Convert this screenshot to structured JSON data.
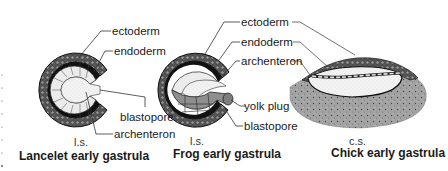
{
  "figure": {
    "panels": [
      {
        "id": "lancelet",
        "caption": "Lancelet early gastrula",
        "section": "l.s.",
        "labels": [
          "ectoderm",
          "endoderm",
          "blastopore",
          "archenteron"
        ]
      },
      {
        "id": "frog",
        "caption": "Frog early gastrula",
        "section": "l.s.",
        "labels": [
          "ectoderm",
          "endoderm",
          "archenteron",
          "yolk plug",
          "blastopore"
        ]
      },
      {
        "id": "chick",
        "caption": "Chick early gastrula",
        "section": "c.s."
      }
    ]
  },
  "colors": {
    "ectoderm_dark": "#2a2a2a",
    "endoderm_light": "#e6e6e6",
    "archenteron_fill": "#f2f2f2",
    "yolk_gray": "#9a9a9a",
    "chick_yolk": "#a8a8a8",
    "leader_line": "#333333"
  }
}
